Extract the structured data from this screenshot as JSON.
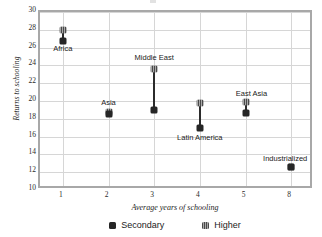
{
  "chart_data": {
    "type": "scatter",
    "title": "",
    "xlabel": "Average years of schooling",
    "ylabel": "Returns to schooling",
    "xtick_labels": [
      "1",
      "2",
      "3",
      "4",
      "5",
      "8"
    ],
    "ytick_labels": [
      "30",
      "28",
      "26",
      "24",
      "22",
      "20",
      "18",
      "16",
      "14",
      "12",
      "10"
    ],
    "ylim": [
      10,
      30
    ],
    "ytick_step": 2,
    "grid": true,
    "legend_position": "bottom",
    "legend": [
      {
        "name": "Secondary",
        "marker": "filled-square",
        "color": "#262626"
      },
      {
        "name": "Higher",
        "marker": "hatched-square",
        "color": "#8a8a8a"
      }
    ],
    "categories": [
      "Africa",
      "Asia",
      "Middle East",
      "Latin America",
      "East Asia",
      "Industrialized"
    ],
    "x": [
      1,
      2,
      3,
      4,
      5,
      8
    ],
    "series": [
      {
        "name": "Secondary",
        "values": [
          26.7,
          18.5,
          19.0,
          17.0,
          18.6,
          12.6
        ]
      },
      {
        "name": "Higher",
        "values": [
          28.0,
          18.8,
          23.6,
          19.8,
          19.9,
          12.6
        ]
      }
    ],
    "points": [
      {
        "label": "Africa",
        "x": 1,
        "secondary": 26.7,
        "higher": 28.0,
        "label_y": 25.9,
        "label_dx": 0
      },
      {
        "label": "Asia",
        "x": 2,
        "secondary": 18.5,
        "higher": 18.8,
        "label_y": 19.9,
        "label_dx": 0
      },
      {
        "label": "Middle East",
        "x": 3,
        "secondary": 19.0,
        "higher": 23.6,
        "label_y": 24.9,
        "label_dx": 0
      },
      {
        "label": "Latin America",
        "x": 4,
        "secondary": 17.0,
        "higher": 19.8,
        "label_y": 16.0,
        "label_dx": 0
      },
      {
        "label": "East Asia",
        "x": 5,
        "secondary": 18.6,
        "higher": 19.9,
        "label_y": 20.9,
        "label_dx": 6
      },
      {
        "label": "Industrialized",
        "x": 8,
        "secondary": 12.6,
        "higher": 12.6,
        "label_y": 13.6,
        "label_dx": -6
      }
    ]
  },
  "axes": {
    "y_title": "Returns to schooling",
    "x_title": "Average years of schooling"
  }
}
